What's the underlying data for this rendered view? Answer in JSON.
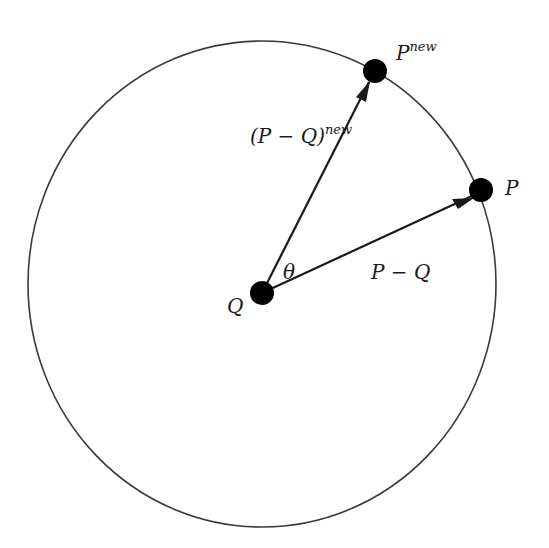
{
  "diagram": {
    "type": "rotation-of-point-about-center",
    "colors": {
      "stroke": "#1a1a1a",
      "circle_stroke": "#3a3a3a",
      "point_fill": "#000000",
      "background": "#ffffff"
    },
    "circle": {
      "cx": 262,
      "cy": 284,
      "rx": 234,
      "ry": 243
    },
    "points": {
      "Q": {
        "label": "Q",
        "x": 262,
        "y": 293,
        "r": 12
      },
      "P": {
        "label": "P",
        "x": 481,
        "y": 190,
        "r": 12
      },
      "P_new": {
        "label": "P",
        "superscript": "new",
        "x": 375,
        "y": 71,
        "r": 12
      }
    },
    "vectors": {
      "P_minus_Q": {
        "label": "P − Q",
        "from": "Q",
        "to": "P"
      },
      "P_minus_Q_new": {
        "label": "(P − Q)",
        "superscript": "new",
        "from": "Q",
        "to": "P_new"
      }
    },
    "angle": {
      "label": "θ"
    }
  }
}
